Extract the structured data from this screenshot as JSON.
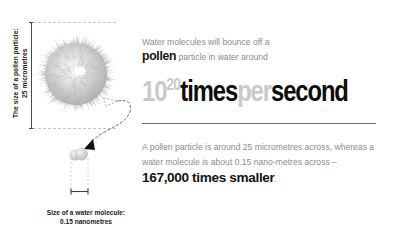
{
  "illustration": {
    "pollen_scale_label": {
      "line1": "The size of a pollen particle:",
      "line2": "25 micrometres"
    },
    "water_scale_label": {
      "line1": "Size of a water molecule:",
      "line2": "0.15 nanometres"
    },
    "pollen_icon_name": "pollen-particle-illustration",
    "water_icon_name": "water-molecule-illustration",
    "connector_icon_name": "zoom-connector-arrow"
  },
  "intro": {
    "line1": "Water molecules will bounce off a",
    "emphasis": "pollen",
    "line2_rest": " particle in water around"
  },
  "big_number": {
    "base": "10",
    "exponent": "20",
    "word_times": "times",
    "word_per": "per",
    "word_second": "second"
  },
  "detail": {
    "part1": "A pollen particle is around 25 micrometres across, whereas a water molecule is about 0.15 nano-metres across – ",
    "emphasis": "167,000 times smaller",
    "part2": "."
  },
  "colors": {
    "body_text_grey": "#8c8c8c",
    "emphasis_black": "#141414",
    "big_number_grey": "#c9c9c9",
    "big_number_black": "#0d0d0d",
    "rule_grey": "#6f6f6f",
    "pollen_grey": "#b9b9b9",
    "background": "#ffffff"
  }
}
